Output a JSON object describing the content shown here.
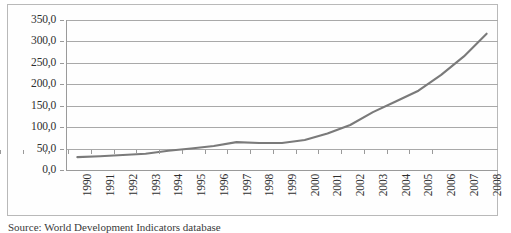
{
  "chart_data": {
    "type": "line",
    "title": "",
    "xlabel": "",
    "ylabel": "",
    "categories": [
      "1990",
      "1991",
      "1992",
      "1993",
      "1994",
      "1995",
      "1996",
      "1997",
      "1998",
      "1999",
      "2000",
      "2001",
      "2002",
      "2003",
      "2004",
      "2005",
      "2006",
      "2007",
      "2008"
    ],
    "values": [
      30.0,
      32.0,
      35.0,
      38.0,
      45.0,
      50.0,
      56.0,
      65.0,
      63.0,
      63.0,
      70.0,
      85.0,
      105.0,
      135.0,
      160.0,
      185.0,
      222.0,
      265.0,
      318.0
    ],
    "series": [
      {
        "name": "series-1",
        "values": [
          30.0,
          32.0,
          35.0,
          38.0,
          45.0,
          50.0,
          56.0,
          65.0,
          63.0,
          63.0,
          70.0,
          85.0,
          105.0,
          135.0,
          160.0,
          185.0,
          222.0,
          265.0,
          318.0
        ],
        "color": "#7a7a7a"
      }
    ],
    "ylim": [
      0,
      350
    ],
    "ytick_values": [
      0,
      50,
      100,
      150,
      200,
      250,
      300,
      350
    ],
    "ytick_labels": [
      "0,0",
      "50,0",
      "100,0",
      "150,0",
      "200,0",
      "250,0",
      "300,0",
      "350,0"
    ],
    "grid": true,
    "grid_axis": "y",
    "legend": false,
    "legend_position": "none",
    "xtick_rotation": 90,
    "decimal_separator": ","
  },
  "caption": {
    "text": "Source: World Development Indicators database"
  },
  "colors": {
    "line": "#7a7a7a",
    "grid": "#a9a9a9",
    "axis": "#9a9a9a",
    "frame": "#b9b9b9",
    "text": "#2f2f2f",
    "background": "#ffffff"
  }
}
